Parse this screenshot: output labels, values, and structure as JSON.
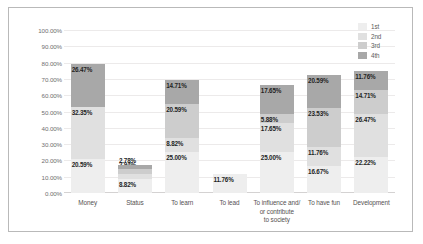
{
  "chart_data": {
    "type": "bar",
    "subtype": "stacked-column",
    "title": "",
    "xlabel": "",
    "ylabel": "",
    "ylim": [
      0,
      100
    ],
    "ytick_labels": [
      "0.00%",
      "10.00%",
      "20.00%",
      "30.00%",
      "40.00%",
      "50.00%",
      "60.00%",
      "70.00%",
      "80.00%",
      "90.00%",
      "100.00%"
    ],
    "ytick_values": [
      0,
      10,
      20,
      30,
      40,
      50,
      60,
      70,
      80,
      90,
      100
    ],
    "grid": true,
    "legend_position": "top-right",
    "legend": [
      "1st",
      "2nd",
      "3rd",
      "4th"
    ],
    "categories": [
      "Money",
      "Status",
      "To learn",
      "To lead",
      "To influence and/ or contribute to society",
      "To have fun",
      "Development"
    ],
    "series": [
      {
        "name": "1st",
        "color": "#eeeeee",
        "values": [
          20.59,
          8.82,
          25.0,
          11.76,
          25.0,
          16.67,
          22.22
        ],
        "labels": [
          "20.59%",
          "8.82%",
          "25.00%",
          "11.76%",
          "25.00%",
          "16.67%",
          "22.22%"
        ]
      },
      {
        "name": "2nd",
        "color": "#e0e0e0",
        "values": [
          32.35,
          2.94,
          8.82,
          0,
          17.65,
          11.76,
          26.47
        ],
        "labels": [
          "32.35%",
          "2.94%",
          "8.82%",
          "",
          "17.65%",
          "11.76%",
          "26.47%"
        ]
      },
      {
        "name": "3rd",
        "color": "#cdcdcd",
        "values": [
          0,
          2.94,
          20.59,
          0,
          5.88,
          23.53,
          14.71
        ],
        "labels": [
          "",
          "2.94%",
          "20.59%",
          "",
          "5.88%",
          "23.53%",
          "14.71%"
        ]
      },
      {
        "name": "4th",
        "color": "#a8a8a8",
        "values": [
          26.47,
          2.78,
          14.71,
          0,
          17.65,
          20.59,
          11.76
        ],
        "labels": [
          "26.47%",
          "2.78%",
          "14.71%",
          "",
          "17.65%",
          "20.59%",
          "11.76%"
        ]
      }
    ],
    "category_label_lines": [
      [
        "Money"
      ],
      [
        "Status"
      ],
      [
        "To learn"
      ],
      [
        "To lead"
      ],
      [
        "To influence and/",
        "or contribute",
        "to society"
      ],
      [
        "To have fun"
      ],
      [
        "Development"
      ]
    ]
  }
}
